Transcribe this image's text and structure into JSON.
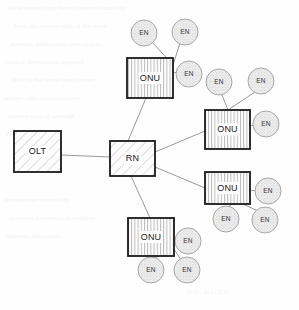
{
  "diagram": {
    "canvas": {
      "width": 299,
      "height": 310
    },
    "colors": {
      "background": "#fefefe",
      "box_stroke": "#1a1a1a",
      "box_fill": "#fdfdfd",
      "hatch_stroke": "#b9b9b9",
      "circle_stroke": "#a8a8a8",
      "circle_fill": "#e9e9e9",
      "link_stroke": "#9a9a9a",
      "label_color": "#1a1a1a",
      "ghost_text": "#f2f2f3"
    },
    "nodes": {
      "olt": {
        "label": "OLT",
        "x": 14,
        "y": 131,
        "w": 47,
        "h": 41,
        "fill": "diagonal-hatch"
      },
      "rn": {
        "label": "RN",
        "x": 110,
        "y": 141,
        "w": 45,
        "h": 35,
        "fill": "diagonal-hatch"
      },
      "onus": [
        {
          "id": "onu-top",
          "label": "ONU",
          "x": 127,
          "y": 58,
          "w": 46,
          "h": 40,
          "fill": "vertical-hatch"
        },
        {
          "id": "onu-right-upper",
          "label": "ONU",
          "x": 205,
          "y": 110,
          "w": 45,
          "h": 39,
          "fill": "vertical-hatch"
        },
        {
          "id": "onu-right-lower",
          "label": "ONU",
          "x": 205,
          "y": 172,
          "w": 45,
          "h": 32,
          "fill": "vertical-hatch"
        },
        {
          "id": "onu-bottom",
          "label": "ONU",
          "x": 128,
          "y": 218,
          "w": 46,
          "h": 38,
          "fill": "vertical-hatch"
        }
      ],
      "ens": [
        {
          "id": "en-t1",
          "label": "EN",
          "cx": 144,
          "cy": 33,
          "r": 13,
          "parent": "onu-top"
        },
        {
          "id": "en-t2",
          "label": "EN",
          "cx": 185,
          "cy": 32,
          "r": 13,
          "parent": "onu-top"
        },
        {
          "id": "en-t3",
          "label": "EN",
          "cx": 189,
          "cy": 74,
          "r": 13,
          "parent": "onu-top"
        },
        {
          "id": "en-ru1",
          "label": "EN",
          "cx": 219,
          "cy": 82,
          "r": 13,
          "parent": "onu-right-upper"
        },
        {
          "id": "en-ru2",
          "label": "EN",
          "cx": 261,
          "cy": 81,
          "r": 13,
          "parent": "onu-right-upper"
        },
        {
          "id": "en-ru3",
          "label": "EN",
          "cx": 266,
          "cy": 124,
          "r": 13,
          "parent": "onu-right-upper"
        },
        {
          "id": "en-rl1",
          "label": "EN",
          "cx": 268,
          "cy": 191,
          "r": 13,
          "parent": "onu-right-lower"
        },
        {
          "id": "en-rl2",
          "label": "EN",
          "cx": 226,
          "cy": 219,
          "r": 13,
          "parent": "onu-right-lower"
        },
        {
          "id": "en-rl3",
          "label": "EN",
          "cx": 265,
          "cy": 220,
          "r": 13,
          "parent": "onu-right-lower"
        },
        {
          "id": "en-b1",
          "label": "EN",
          "cx": 188,
          "cy": 241,
          "r": 13,
          "parent": "onu-bottom"
        },
        {
          "id": "en-b2",
          "label": "EN",
          "cx": 151,
          "cy": 270,
          "r": 13,
          "parent": "onu-bottom"
        },
        {
          "id": "en-b3",
          "label": "EN",
          "cx": 187,
          "cy": 270,
          "r": 13,
          "parent": "onu-bottom"
        }
      ]
    },
    "links": [
      {
        "id": "link-olt-rn",
        "from": "olt",
        "to": "rn",
        "x1": 61,
        "y1": 155,
        "x2": 110,
        "y2": 157
      },
      {
        "id": "link-rn-onu-top",
        "from": "rn",
        "to": "onu-top",
        "x1": 128,
        "y1": 141,
        "x2": 146,
        "y2": 98
      },
      {
        "id": "link-rn-onu-right-upper",
        "from": "rn",
        "to": "onu-right-upper",
        "x1": 155,
        "y1": 152,
        "x2": 205,
        "y2": 131
      },
      {
        "id": "link-rn-onu-right-lower",
        "from": "rn",
        "to": "onu-right-lower",
        "x1": 155,
        "y1": 167,
        "x2": 205,
        "y2": 188
      },
      {
        "id": "link-rn-onu-bottom",
        "from": "rn",
        "to": "onu-bottom",
        "x1": 131,
        "y1": 176,
        "x2": 150,
        "y2": 218
      },
      {
        "id": "link-onu-top-en1",
        "x1": 173,
        "y1": 65,
        "x2": 152,
        "y2": 42
      },
      {
        "id": "link-onu-top-en2",
        "x1": 173,
        "y1": 65,
        "x2": 180,
        "y2": 43
      },
      {
        "id": "link-onu-top-en3",
        "x1": 173,
        "y1": 72,
        "x2": 177,
        "y2": 73
      },
      {
        "id": "link-onu-ru-en1",
        "x1": 228,
        "y1": 110,
        "x2": 222,
        "y2": 95
      },
      {
        "id": "link-onu-ru-en2",
        "x1": 228,
        "y1": 110,
        "x2": 255,
        "y2": 92
      },
      {
        "id": "link-onu-ru-en3",
        "x1": 250,
        "y1": 126,
        "x2": 254,
        "y2": 125
      },
      {
        "id": "link-onu-rl-en1",
        "x1": 250,
        "y1": 190,
        "x2": 256,
        "y2": 191
      },
      {
        "id": "link-onu-rl-en2",
        "x1": 232,
        "y1": 204,
        "x2": 228,
        "y2": 207
      },
      {
        "id": "link-onu-rl-en3",
        "x1": 243,
        "y1": 204,
        "x2": 258,
        "y2": 211
      },
      {
        "id": "link-onu-b-en1",
        "x1": 174,
        "y1": 237,
        "x2": 176,
        "y2": 240
      },
      {
        "id": "link-onu-b-en2",
        "x1": 160,
        "y1": 256,
        "x2": 153,
        "y2": 258
      },
      {
        "id": "link-onu-b-en3",
        "x1": 174,
        "y1": 249,
        "x2": 181,
        "y2": 260
      }
    ]
  },
  "ghost_artifacts": [
    {
      "text": "the scanned page shows faint residual text",
      "x": 8,
      "y": 4
    },
    {
      "text": "from the reverse side of the sheet",
      "x": 14,
      "y": 22
    },
    {
      "text": "network architecture description",
      "x": 10,
      "y": 40
    },
    {
      "text": "optical distribution segment",
      "x": 6,
      "y": 58
    },
    {
      "text": "fiber to the home deployment",
      "x": 12,
      "y": 76
    },
    {
      "text": "splitter ratio considerations",
      "x": 4,
      "y": 94
    },
    {
      "text": "passive optical network",
      "x": 8,
      "y": 112
    },
    {
      "text": "terminal equipment",
      "x": 6,
      "y": 130
    },
    {
      "text": "downstream bandwidth",
      "x": 4,
      "y": 196
    },
    {
      "text": "upstream transmission window",
      "x": 8,
      "y": 214
    },
    {
      "text": "dynamic allocation",
      "x": 6,
      "y": 232
    },
    {
      "text": "ONU and OLT",
      "x": 186,
      "y": 288
    }
  ]
}
